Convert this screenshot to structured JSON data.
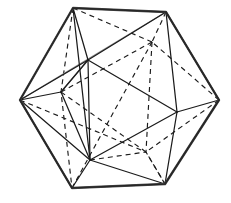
{
  "figure": {
    "title": "Icosahedron wireframe with inscribed polyhedron",
    "shape_name": "icosahedron",
    "inner_shape_name": "inscribed-octahedron",
    "background_color": "#ffffff",
    "line_color": "#1b1b1b",
    "outline_color": "#4d4d4d",
    "faint_line_color": "#8c8c8c",
    "hidden_line_style": "dashed",
    "visible_line_style": "solid",
    "canvas": {
      "width": 231,
      "height": 203
    },
    "vertices": {
      "top_left": {
        "label": "A",
        "x": 73,
        "y": 8
      },
      "top_right": {
        "label": "B",
        "x": 166,
        "y": 12
      },
      "left": {
        "label": "C",
        "x": 20,
        "y": 100
      },
      "right": {
        "label": "D",
        "x": 219,
        "y": 100
      },
      "bottom_left": {
        "label": "E",
        "x": 72,
        "y": 188
      },
      "bottom_right": {
        "label": "F",
        "x": 165,
        "y": 184
      },
      "inner_upper_left": {
        "label": "G",
        "x": 88,
        "y": 60
      },
      "inner_upper_right": {
        "label": "H",
        "x": 152,
        "y": 42
      },
      "inner_left": {
        "label": "I",
        "x": 61,
        "y": 92
      },
      "inner_right": {
        "label": "J",
        "x": 177,
        "y": 112
      },
      "inner_lower_left": {
        "label": "K",
        "x": 90,
        "y": 160
      },
      "inner_lower_right": {
        "label": "L",
        "x": 146,
        "y": 152
      }
    },
    "outline_edges": [
      {
        "name": "outline-top",
        "from": "top_left",
        "to": "top_right"
      },
      {
        "name": "outline-upper-right",
        "from": "top_right",
        "to": "right"
      },
      {
        "name": "outline-lower-right",
        "from": "right",
        "to": "bottom_right"
      },
      {
        "name": "outline-bottom",
        "from": "bottom_right",
        "to": "bottom_left"
      },
      {
        "name": "outline-lower-left",
        "from": "bottom_left",
        "to": "left"
      },
      {
        "name": "outline-upper-left",
        "from": "left",
        "to": "top_left"
      }
    ],
    "visible_edges": [
      {
        "name": "edge-A-G"
      },
      {
        "name": "edge-A-I"
      },
      {
        "name": "edge-A-K"
      },
      {
        "name": "edge-B-G"
      },
      {
        "name": "edge-B-H"
      },
      {
        "name": "edge-B-J"
      },
      {
        "name": "edge-C-G"
      },
      {
        "name": "edge-C-I"
      },
      {
        "name": "edge-C-K"
      },
      {
        "name": "edge-D-J"
      },
      {
        "name": "edge-D-L"
      },
      {
        "name": "edge-D-H"
      },
      {
        "name": "edge-E-K"
      },
      {
        "name": "edge-E-I"
      },
      {
        "name": "edge-E-L"
      },
      {
        "name": "edge-F-L"
      },
      {
        "name": "edge-F-K"
      },
      {
        "name": "edge-F-J"
      },
      {
        "name": "edge-G-K"
      },
      {
        "name": "edge-G-J"
      },
      {
        "name": "edge-J-K"
      },
      {
        "name": "edge-G-I"
      },
      {
        "name": "edge-I-K"
      },
      {
        "name": "edge-L-J"
      }
    ],
    "hidden_edges": [
      {
        "name": "hidden-A-H"
      },
      {
        "name": "hidden-A-L"
      },
      {
        "name": "hidden-B-L"
      },
      {
        "name": "hidden-H-I"
      },
      {
        "name": "hidden-H-L"
      },
      {
        "name": "hidden-H-J"
      },
      {
        "name": "hidden-I-L"
      },
      {
        "name": "hidden-E-H"
      },
      {
        "name": "hidden-F-H"
      },
      {
        "name": "hidden-C-H"
      }
    ],
    "counts": {
      "outer_vertices": 6,
      "inner_vertices": 6,
      "total_vertices": 12
    }
  }
}
